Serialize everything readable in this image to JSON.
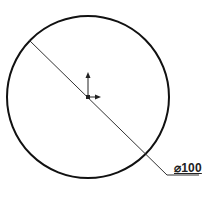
{
  "drawing": {
    "dimension": {
      "label": "⌀100",
      "type": "diameter",
      "value": 100
    },
    "circle": {
      "center": [
        88,
        97
      ],
      "radius": 81
    },
    "colors": {
      "stroke": "#111111",
      "leader": "#333333",
      "background": "#ffffff"
    }
  }
}
